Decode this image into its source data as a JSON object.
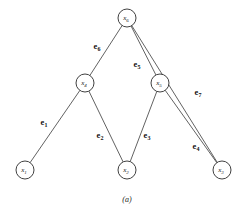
{
  "figure": {
    "caption": "(a)",
    "background_color": "#ffffff",
    "stroke_color": "#3a3a3a",
    "node_fill_color": "#ffffff",
    "node_stroke_color": "#2b2b2b",
    "text_color": "#111111"
  },
  "chart_data": {
    "type": "diagram",
    "title": "",
    "subtitle": "",
    "xlabel": "",
    "ylabel": "",
    "caption": "(a)",
    "layout": "tree",
    "grid": false,
    "legend": "none",
    "nodes": [
      {
        "id": "x6",
        "label": "x",
        "sub": "6",
        "x": 127,
        "y": 18,
        "r": 9
      },
      {
        "id": "x4",
        "label": "x",
        "sub": "4",
        "x": 85,
        "y": 83,
        "r": 9
      },
      {
        "id": "x5",
        "label": "x",
        "sub": "5",
        "x": 160,
        "y": 83,
        "r": 9
      },
      {
        "id": "x1",
        "label": "x",
        "sub": "1",
        "x": 25,
        "y": 170,
        "r": 9
      },
      {
        "id": "x2",
        "label": "x",
        "sub": "2",
        "x": 127,
        "y": 170,
        "r": 9
      },
      {
        "id": "x3",
        "label": "x",
        "sub": "3",
        "x": 222,
        "y": 170,
        "r": 9
      }
    ],
    "edges": [
      {
        "id": "e1",
        "label": "e",
        "sub": "1",
        "from": "x4",
        "to": "x1",
        "label_x": 44,
        "label_y": 122
      },
      {
        "id": "e2",
        "label": "e",
        "sub": "2",
        "from": "x4",
        "to": "x2",
        "label_x": 100,
        "label_y": 135
      },
      {
        "id": "e3",
        "label": "e",
        "sub": "3",
        "from": "x5",
        "to": "x2",
        "label_x": 147,
        "label_y": 135
      },
      {
        "id": "e4",
        "label": "e",
        "sub": "4",
        "from": "x5",
        "to": "x3",
        "label_x": 196,
        "label_y": 146
      },
      {
        "id": "e5",
        "label": "e",
        "sub": "5",
        "from": "x6",
        "to": "x5",
        "label_x": 137,
        "label_y": 64
      },
      {
        "id": "e6",
        "label": "e",
        "sub": "6",
        "from": "x6",
        "to": "x4",
        "label_x": 97,
        "label_y": 46
      },
      {
        "id": "e7",
        "label": "e",
        "sub": "7",
        "from": "x6",
        "to": "x3",
        "label_x": 198,
        "label_y": 92
      }
    ]
  }
}
